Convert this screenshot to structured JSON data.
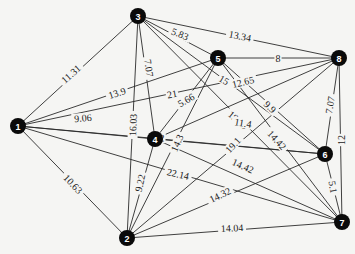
{
  "graph": {
    "type": "weighted-undirected",
    "nodes": [
      {
        "id": "1",
        "label": "1",
        "x": 18,
        "y": 126
      },
      {
        "id": "2",
        "label": "2",
        "x": 127,
        "y": 238
      },
      {
        "id": "3",
        "label": "3",
        "x": 138,
        "y": 16
      },
      {
        "id": "4",
        "label": "4",
        "x": 155,
        "y": 139
      },
      {
        "id": "5",
        "label": "5",
        "x": 218,
        "y": 58
      },
      {
        "id": "6",
        "label": "6",
        "x": 325,
        "y": 154
      },
      {
        "id": "7",
        "label": "7",
        "x": 342,
        "y": 222
      },
      {
        "id": "8",
        "label": "8",
        "x": 339,
        "y": 58
      }
    ],
    "edges": [
      {
        "from": "1",
        "to": "3",
        "weight": "11.31",
        "lx": 71,
        "ly": 74,
        "rot": -42
      },
      {
        "from": "1",
        "to": "5",
        "weight": "13.9",
        "lx": 117,
        "ly": 93,
        "rot": -18
      },
      {
        "from": "1",
        "to": "8",
        "weight": "21",
        "lx": 172,
        "ly": 94,
        "rot": -11
      },
      {
        "from": "1",
        "to": "4",
        "weight": "9.06",
        "lx": 83,
        "ly": 118,
        "rot": -5
      },
      {
        "from": "1",
        "to": "6",
        "weight": "2",
        "lx": 162,
        "ly": 138,
        "rot": 3
      },
      {
        "from": "1",
        "to": "7",
        "weight": "22.14",
        "lx": 178,
        "ly": 174,
        "rot": 13
      },
      {
        "from": "1",
        "to": "2",
        "weight": "10.63",
        "lx": 73,
        "ly": 184,
        "rot": 46
      },
      {
        "from": "3",
        "to": "5",
        "weight": "5.83",
        "lx": 180,
        "ly": 34,
        "rot": 22
      },
      {
        "from": "3",
        "to": "8",
        "weight": "13.34",
        "lx": 240,
        "ly": 36,
        "rot": 11
      },
      {
        "from": "3",
        "to": "4",
        "weight": "7.07",
        "lx": 149,
        "ly": 68,
        "rot": 82
      },
      {
        "from": "3",
        "to": "2",
        "weight": "16.03",
        "lx": 133,
        "ly": 125,
        "rot": -88
      },
      {
        "from": "3",
        "to": "6",
        "weight": "15",
        "lx": 224,
        "ly": 80,
        "rot": 30
      },
      {
        "from": "3",
        "to": "7",
        "weight": "19.85",
        "lx": 238,
        "ly": 120,
        "rot": 40
      },
      {
        "from": "5",
        "to": "8",
        "weight": "8",
        "lx": 278,
        "ly": 58,
        "rot": 0
      },
      {
        "from": "5",
        "to": "4",
        "weight": "5.66",
        "lx": 186,
        "ly": 100,
        "rot": -30
      },
      {
        "from": "5",
        "to": "2",
        "weight": "14.3",
        "lx": 177,
        "ly": 143,
        "rot": -66
      },
      {
        "from": "5",
        "to": "6",
        "weight": "9.9",
        "lx": 270,
        "ly": 107,
        "rot": 45
      },
      {
        "from": "5",
        "to": "7",
        "weight": "14.42",
        "lx": 277,
        "ly": 140,
        "rot": 48
      },
      {
        "from": "4",
        "to": "8",
        "weight": "12.65",
        "lx": 243,
        "ly": 82,
        "rot": -14
      },
      {
        "from": "4",
        "to": "6",
        "weight": "11.4",
        "lx": 243,
        "ly": 123,
        "rot": 10
      },
      {
        "from": "4",
        "to": "7",
        "weight": "14.42",
        "lx": 243,
        "ly": 166,
        "rot": 24
      },
      {
        "from": "4",
        "to": "2",
        "weight": "9.22",
        "lx": 140,
        "ly": 183,
        "rot": -78
      },
      {
        "from": "8",
        "to": "2",
        "weight": "19.1",
        "lx": 233,
        "ly": 145,
        "rot": -47
      },
      {
        "from": "8",
        "to": "6",
        "weight": "7.07",
        "lx": 330,
        "ly": 105,
        "rot": -80
      },
      {
        "from": "8",
        "to": "7",
        "weight": "12",
        "lx": 341,
        "ly": 140,
        "rot": -90
      },
      {
        "from": "6",
        "to": "2",
        "weight": "14.32",
        "lx": 220,
        "ly": 195,
        "rot": -26
      },
      {
        "from": "6",
        "to": "7",
        "weight": "5.1",
        "lx": 333,
        "ly": 187,
        "rot": 80
      },
      {
        "from": "2",
        "to": "7",
        "weight": "14.04",
        "lx": 232,
        "ly": 228,
        "rot": -3
      }
    ]
  }
}
